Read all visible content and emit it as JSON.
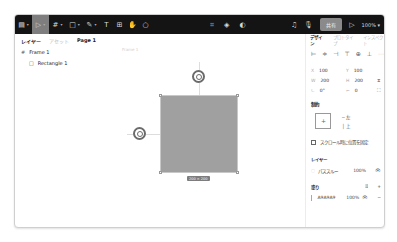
{
  "toolbar": {
    "left_tools": [
      {
        "name": "main-menu",
        "glyph": "▤",
        "chevron": true
      },
      {
        "name": "move-tool",
        "glyph": "▷",
        "chevron": true,
        "active": true
      },
      {
        "name": "frame-tool",
        "glyph": "#",
        "chevron": true
      },
      {
        "name": "shape-tool",
        "glyph": "□",
        "chevron": true
      },
      {
        "name": "pen-tool",
        "glyph": "✎",
        "chevron": true
      },
      {
        "name": "text-tool",
        "glyph": "T",
        "chevron": false
      },
      {
        "name": "resources-tool",
        "glyph": "⊞",
        "chevron": false
      },
      {
        "name": "hand-tool",
        "glyph": "✋",
        "chevron": false
      },
      {
        "name": "comment-tool",
        "glyph": "○",
        "chevron": false
      }
    ],
    "center_tools": [
      {
        "name": "component",
        "glyph": "⌗"
      },
      {
        "name": "mask",
        "glyph": "◈"
      },
      {
        "name": "contrast",
        "glyph": "◐"
      }
    ],
    "share_label": "共有",
    "zoom_level": "100%",
    "chev": "▾"
  },
  "left_panel": {
    "tabs": [
      "レイヤー",
      "アセット"
    ],
    "page": "Page 1",
    "layers": [
      {
        "name": "Frame 1",
        "icon": "#",
        "indent": 0
      },
      {
        "name": "Rectangle 1",
        "icon": "□",
        "indent": 1
      }
    ]
  },
  "canvas": {
    "frame_label": "Frame 1",
    "dimension_label": "200 × 200",
    "rect_color": "#a0a0a0"
  },
  "right_panel": {
    "tabs": [
      "デザイン",
      "プロトタイプ",
      "インスペクト"
    ],
    "align_icons": [
      "⊨",
      "≑",
      "⊣",
      "⊤",
      "⊕",
      "⊥",
      "⋯"
    ],
    "position": {
      "x_label": "X",
      "x": "100",
      "y_label": "Y",
      "y": "100"
    },
    "size": {
      "w_label": "W",
      "w": "200",
      "h_label": "H",
      "h": "200"
    },
    "rotation": {
      "r_label": "∟",
      "r": "0°",
      "radius_label": "⌐",
      "radius": "0"
    },
    "constraints": {
      "title": "制約",
      "horizontal": "─ 左",
      "vertical": "│ 上",
      "fix_scroll_label": "スクロール時に位置を固定"
    },
    "layer": {
      "title": "レイヤー",
      "blend": "パススルー",
      "opacity": "100%"
    },
    "fill": {
      "title": "塗り",
      "hex": "A9A9A9",
      "opacity": "100%",
      "color": "#a9a9a9"
    }
  }
}
